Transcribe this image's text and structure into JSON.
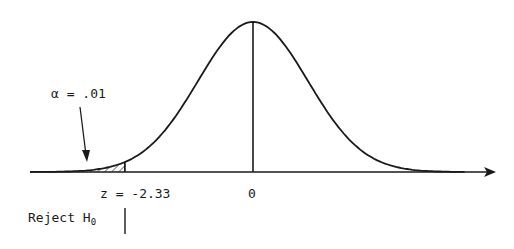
{
  "diagram": {
    "type": "normal-distribution-left-tail-test",
    "alpha_label": "α = .01",
    "critical_label": "z = -2.33",
    "mean_label": "0",
    "reject_label": "Reject H",
    "reject_subscript": "0",
    "critical_z": -2.33,
    "alpha": 0.01,
    "colors": {
      "ink": "#1a1a1a",
      "background": "#ffffff"
    }
  }
}
